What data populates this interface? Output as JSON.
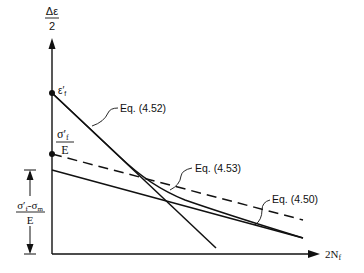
{
  "axes": {
    "y_label_num": "Δε",
    "y_label_den": "2",
    "x_label": "2N",
    "x_label_sub": "f"
  },
  "intercepts": {
    "eps_f": "ε′",
    "eps_f_sub": "f",
    "sigma_f_num": "σ′",
    "sigma_f_sub": "f",
    "sigma_f_den": "E",
    "mean_num_a": "σ′",
    "mean_num_a_sub": "f",
    "mean_num_b": "-σ",
    "mean_num_b_sub": "m",
    "mean_den": "E"
  },
  "labels": {
    "eq452": "Eq. (4.52)",
    "eq453": "Eq. (4.53)",
    "eq450": "Eq. (4.50)"
  },
  "colors": {
    "ink": "#111111",
    "background": "#ffffff"
  }
}
